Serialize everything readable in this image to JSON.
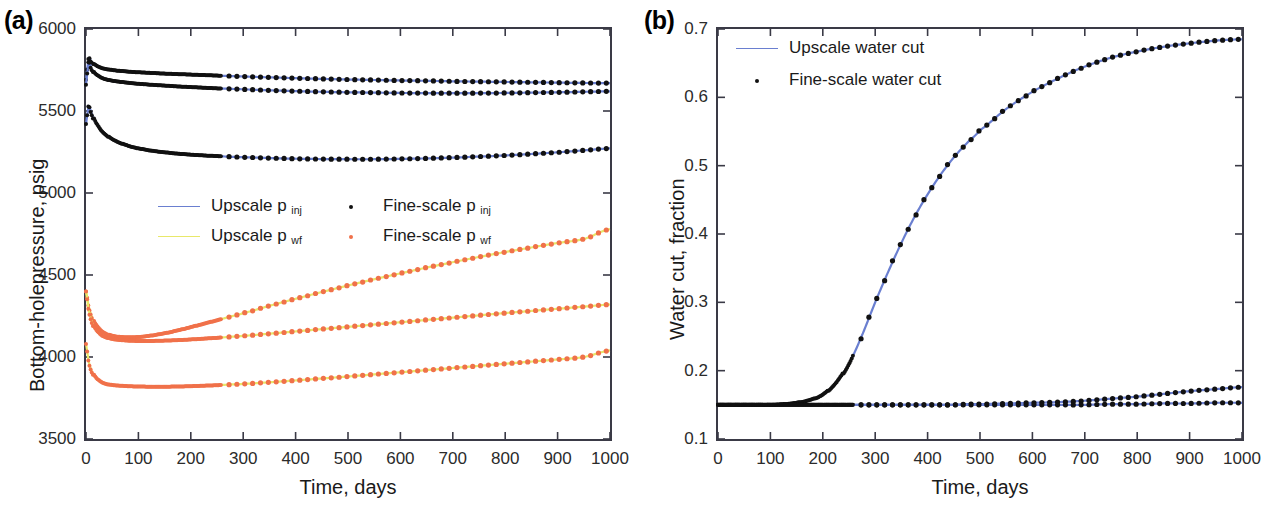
{
  "figure": {
    "panel_a_label": "(a)",
    "panel_b_label": "(b)"
  },
  "panel_a": {
    "xlabel": "Time, days",
    "ylabel": "Bottom-holepressure, psig",
    "xticks": [
      "0",
      "100",
      "200",
      "300",
      "400",
      "500",
      "600",
      "700",
      "800",
      "900",
      "1000"
    ],
    "yticks": [
      "3500",
      "4000",
      "4500",
      "5000",
      "5500",
      "6000"
    ],
    "legend": {
      "upscale_pinj": "Upscale p",
      "upscale_pinj_sub": "inj",
      "upscale_pwf": "Upscale p",
      "upscale_pwf_sub": "wf",
      "fine_pinj": "Fine-scale p",
      "fine_pinj_sub": "inj",
      "fine_pwf": "Fine-scale p",
      "fine_pwf_sub": "wf"
    }
  },
  "panel_b": {
    "xlabel": "Time, days",
    "ylabel": "Water cut, fraction",
    "xticks": [
      "0",
      "100",
      "200",
      "300",
      "400",
      "500",
      "600",
      "700",
      "800",
      "900",
      "1000"
    ],
    "yticks": [
      "0.1",
      "0.2",
      "0.3",
      "0.4",
      "0.5",
      "0.6",
      "0.7"
    ],
    "legend": {
      "upscale": "Upscale water cut",
      "fine": "Fine-scale water cut"
    }
  },
  "colors": {
    "upscale_pinj_line": "#6a7fd0",
    "upscale_pwf_line": "#e8e86a",
    "fine_pinj_dot": "#111111",
    "fine_pwf_dot": "#f0714a",
    "upscale_watercut_line": "#6a7fd0",
    "fine_watercut_dot": "#111111",
    "axis": "#3a3a46"
  },
  "chart_data": [
    {
      "type": "line",
      "panel": "(a)",
      "title": "",
      "xlabel": "Time, days",
      "ylabel": "Bottom-holepressure, psig",
      "xlim": [
        0,
        1000
      ],
      "ylim": [
        3500,
        6000
      ],
      "xticks": [
        0,
        100,
        200,
        300,
        400,
        500,
        600,
        700,
        800,
        900,
        1000
      ],
      "yticks": [
        3500,
        4000,
        4500,
        5000,
        5500,
        6000
      ],
      "grid": false,
      "legend_position": "center-left",
      "legend_entries": [
        "Upscale p_inj",
        "Fine-scale p_inj",
        "Upscale p_wf",
        "Fine-scale p_wf"
      ],
      "x": [
        0,
        5,
        10,
        15,
        20,
        30,
        40,
        50,
        60,
        80,
        100,
        125,
        150,
        175,
        200,
        225,
        250,
        275,
        300,
        350,
        400,
        450,
        500,
        550,
        600,
        650,
        700,
        750,
        800,
        850,
        900,
        950,
        1000
      ],
      "series": [
        {
          "name": "p_inj well 1 (upper)",
          "style": "line+dots",
          "color": "#6a7fd0",
          "values": [
            5690,
            5820,
            5800,
            5785,
            5775,
            5762,
            5755,
            5750,
            5746,
            5740,
            5736,
            5732,
            5728,
            5725,
            5722,
            5719,
            5716,
            5713,
            5710,
            5705,
            5700,
            5696,
            5692,
            5689,
            5686,
            5684,
            5681,
            5679,
            5677,
            5675,
            5673,
            5671,
            5670
          ]
        },
        {
          "name": "p_inj well 2 (middle)",
          "style": "line+dots",
          "color": "#6a7fd0",
          "values": [
            5660,
            5800,
            5760,
            5735,
            5720,
            5702,
            5692,
            5685,
            5680,
            5672,
            5666,
            5660,
            5655,
            5650,
            5646,
            5642,
            5638,
            5635,
            5632,
            5626,
            5621,
            5617,
            5614,
            5612,
            5610,
            5609,
            5609,
            5609,
            5610,
            5612,
            5614,
            5617,
            5620
          ]
        },
        {
          "name": "p_inj well 3 (lower)",
          "style": "line+dots",
          "color": "#6a7fd0",
          "values": [
            5420,
            5530,
            5490,
            5450,
            5420,
            5378,
            5350,
            5328,
            5312,
            5288,
            5272,
            5258,
            5248,
            5240,
            5234,
            5229,
            5225,
            5221,
            5218,
            5213,
            5209,
            5207,
            5206,
            5206,
            5208,
            5211,
            5216,
            5222,
            5229,
            5238,
            5248,
            5260,
            5272
          ]
        },
        {
          "name": "p_wf well 1 (upper, rising)",
          "style": "line+dots",
          "color": "#f0714a",
          "values": [
            4400,
            4310,
            4255,
            4215,
            4190,
            4158,
            4140,
            4130,
            4124,
            4120,
            4122,
            4131,
            4145,
            4162,
            4182,
            4203,
            4224,
            4246,
            4268,
            4312,
            4355,
            4396,
            4436,
            4474,
            4510,
            4545,
            4578,
            4610,
            4640,
            4668,
            4695,
            4720,
            4780
          ]
        },
        {
          "name": "p_wf well 2 (middle)",
          "style": "line+dots",
          "color": "#f0714a",
          "values": [
            4400,
            4290,
            4225,
            4185,
            4160,
            4132,
            4118,
            4110,
            4105,
            4100,
            4098,
            4098,
            4100,
            4103,
            4107,
            4112,
            4117,
            4123,
            4129,
            4142,
            4156,
            4170,
            4184,
            4198,
            4212,
            4226,
            4240,
            4254,
            4268,
            4281,
            4294,
            4307,
            4320
          ]
        },
        {
          "name": "p_wf well 3 (lower)",
          "style": "line+dots",
          "color": "#f0714a",
          "values": [
            4080,
            3975,
            3920,
            3888,
            3868,
            3846,
            3835,
            3829,
            3826,
            3822,
            3820,
            3819,
            3819,
            3820,
            3822,
            3825,
            3828,
            3832,
            3836,
            3846,
            3857,
            3869,
            3881,
            3894,
            3907,
            3920,
            3933,
            3946,
            3959,
            3972,
            3985,
            4000,
            4040
          ]
        }
      ]
    },
    {
      "type": "line",
      "panel": "(b)",
      "title": "",
      "xlabel": "Time, days",
      "ylabel": "Water cut, fraction",
      "xlim": [
        0,
        1000
      ],
      "ylim": [
        0.1,
        0.7
      ],
      "xticks": [
        0,
        100,
        200,
        300,
        400,
        500,
        600,
        700,
        800,
        900,
        1000
      ],
      "yticks": [
        0.1,
        0.2,
        0.3,
        0.4,
        0.5,
        0.6,
        0.7
      ],
      "grid": false,
      "legend_position": "upper-left",
      "legend_entries": [
        "Upscale water cut",
        "Fine-scale water cut"
      ],
      "x": [
        0,
        25,
        50,
        75,
        100,
        125,
        150,
        175,
        200,
        225,
        250,
        275,
        300,
        325,
        350,
        375,
        400,
        425,
        450,
        475,
        500,
        550,
        600,
        650,
        700,
        750,
        800,
        850,
        900,
        950,
        1000
      ],
      "series": [
        {
          "name": "water cut producer 1 (breakthrough)",
          "style": "line+dots",
          "color": "#111111",
          "values": [
            0.15,
            0.15,
            0.15,
            0.15,
            0.15,
            0.151,
            0.153,
            0.157,
            0.165,
            0.182,
            0.21,
            0.252,
            0.3,
            0.345,
            0.387,
            0.425,
            0.458,
            0.487,
            0.512,
            0.533,
            0.552,
            0.583,
            0.608,
            0.628,
            0.645,
            0.658,
            0.667,
            0.674,
            0.679,
            0.683,
            0.685
          ]
        },
        {
          "name": "water cut producer 2 (flat, late rise)",
          "style": "line+dots",
          "color": "#111111",
          "values": [
            0.15,
            0.15,
            0.15,
            0.15,
            0.15,
            0.15,
            0.15,
            0.15,
            0.15,
            0.15,
            0.15,
            0.15,
            0.15,
            0.15,
            0.15,
            0.15,
            0.15,
            0.15,
            0.15,
            0.151,
            0.151,
            0.152,
            0.153,
            0.154,
            0.156,
            0.159,
            0.162,
            0.166,
            0.17,
            0.173,
            0.176
          ]
        },
        {
          "name": "water cut producer 3 (flat)",
          "style": "line+dots",
          "color": "#111111",
          "values": [
            0.15,
            0.15,
            0.15,
            0.15,
            0.15,
            0.15,
            0.15,
            0.15,
            0.15,
            0.15,
            0.15,
            0.15,
            0.15,
            0.15,
            0.15,
            0.15,
            0.15,
            0.15,
            0.15,
            0.15,
            0.15,
            0.15,
            0.15,
            0.15,
            0.15,
            0.151,
            0.151,
            0.152,
            0.152,
            0.153,
            0.153
          ]
        }
      ]
    }
  ]
}
